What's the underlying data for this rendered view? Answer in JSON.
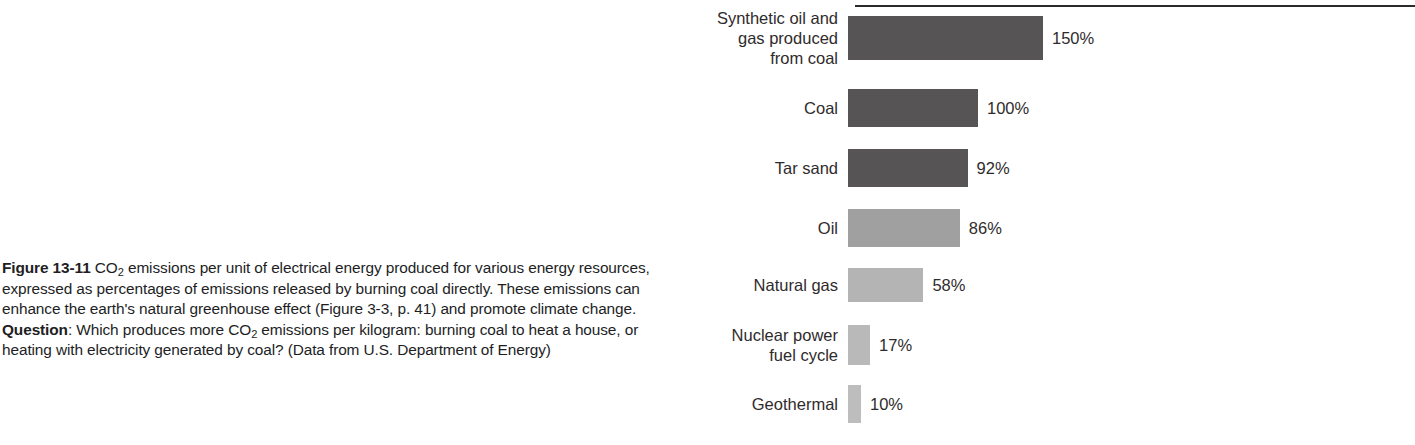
{
  "caption": {
    "figure_number": "Figure 13-11",
    "text_part_1": "CO",
    "sub_1": "2",
    "text_part_2": " emissions per unit of electrical energy produced for various energy resources, expressed as percentages of emissions released by burning coal directly. These emissions can enhance the earth's natural greenhouse effect (Figure 3-3, p. 41) and promote climate change. ",
    "question_label": "Question",
    "question_part_1": ": Which produces more CO",
    "sub_2": "2",
    "question_part_2": " emissions per kilogram: burning coal to heat a house, or heating with electricity generated by coal? ",
    "source": "(Data from U.S. Department of Energy)"
  },
  "chart_data": {
    "type": "bar",
    "orientation": "horizontal",
    "title": "",
    "xlabel": "",
    "ylabel": "",
    "unit": "%",
    "baseline_label": "Coal = 100%",
    "xlim": [
      0,
      150
    ],
    "grid": false,
    "legend": false,
    "categories": [
      "Synthetic oil and\ngas produced\nfrom coal",
      "Coal",
      "Tar sand",
      "Oil",
      "Natural gas",
      "Nuclear power\nfuel cycle",
      "Geothermal"
    ],
    "values": [
      150,
      100,
      92,
      86,
      58,
      17,
      10
    ],
    "value_labels": [
      "150%",
      "100%",
      "92%",
      "86%",
      "58%",
      "17%",
      "10%"
    ],
    "bar_colors": [
      "#565455",
      "#565455",
      "#565455",
      "#a0a0a0",
      "#b4b4b4",
      "#b9b9b9",
      "#bdbdbd"
    ],
    "bar_heights_px": [
      44,
      38,
      38,
      38,
      34,
      40,
      38
    ],
    "row_tops_px": [
      16,
      89,
      149,
      209,
      268,
      325,
      385
    ],
    "px_per_percent": 1.3,
    "bar_origin_x_px": 167,
    "rule_color": "#2a2a2a"
  }
}
